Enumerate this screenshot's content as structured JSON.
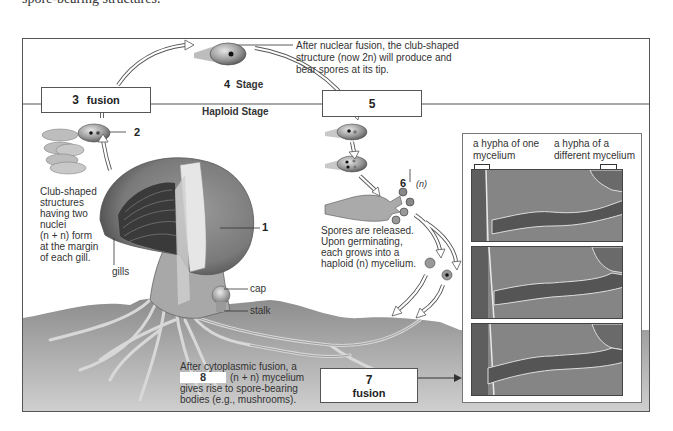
{
  "page": {
    "top_text": "spore-bearing structures."
  },
  "diagram": {
    "stage_labels": {
      "stage_4": "Stage",
      "haploid": "Haploid Stage"
    },
    "boxes": {
      "box_3": {
        "number": "3",
        "label": "fusion"
      },
      "box_5": {
        "number": "5",
        "label": ""
      },
      "box_7": {
        "number": "7",
        "label": "fusion"
      },
      "box_8": {
        "number": "8"
      }
    },
    "numbers": {
      "n1": "1",
      "n2": "2",
      "n4": "4",
      "n6": "6",
      "n6_ploidy": "(n)"
    },
    "annotations": {
      "nuclear_fusion": [
        "After nuclear fusion, the club-shaped",
        "structure (now 2n) will produce and",
        "bear spores at its tip."
      ],
      "club_shaped": [
        "Club-shaped",
        "structures",
        "having two",
        "nuclei",
        "(n + n) form",
        "at the margin",
        "of each gill."
      ],
      "gills": "gills",
      "cap": "cap",
      "stalk": "stalk",
      "spores_released": [
        "Spores are released.",
        "Upon germinating,",
        "each grows into a",
        "haploid (n) mycelium."
      ],
      "cytoplasmic_fusion": [
        "After cytoplasmic fusion, a",
        "(n + n) mycelium",
        "gives rise to spore-bearing",
        "bodies (e.g., mushrooms)."
      ]
    },
    "photo_panel": {
      "label_left": [
        "a hypha of one",
        "mycelium"
      ],
      "label_right": [
        "a hypha of a",
        "different mycelium"
      ],
      "photo_count": 3
    },
    "colors": {
      "frame": "#555555",
      "soil": "#a9a9a9",
      "mushroom": "#8c8c8c",
      "photo_bg": "#7c7c7c"
    }
  }
}
